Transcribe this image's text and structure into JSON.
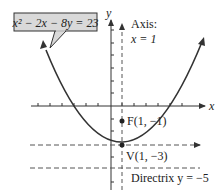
{
  "equation": {
    "text": "x² − 2x − 8y = 23",
    "box_color": "#d9d9d9"
  },
  "axes": {
    "x_label": "x",
    "y_label": "y"
  },
  "axis_of_symmetry": {
    "line1": "Axis:",
    "line2": "x = 1"
  },
  "focus": {
    "label": "F(1, −1)"
  },
  "vertex": {
    "label": "V(1, −3)"
  },
  "directrix": {
    "label": "Directrix y = −5"
  },
  "colors": {
    "curve": "#333333",
    "axes": "#333333",
    "dashed": "#555555"
  }
}
